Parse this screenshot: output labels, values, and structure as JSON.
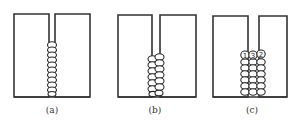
{
  "figure": {
    "panels": [
      {
        "id": "a",
        "caption": "(a)",
        "description": "narrow groove, single-pass vertical weld bead stack"
      },
      {
        "id": "b",
        "caption": "(b)",
        "description": "medium groove, two columns of weld beads"
      },
      {
        "id": "c",
        "caption": "(c)",
        "description": "wide groove, three columns of weld beads with pass order labels"
      }
    ],
    "pass_labels": [
      "1",
      "3",
      "2"
    ],
    "colors": {
      "line": "#333333",
      "background": "#ffffff"
    }
  }
}
